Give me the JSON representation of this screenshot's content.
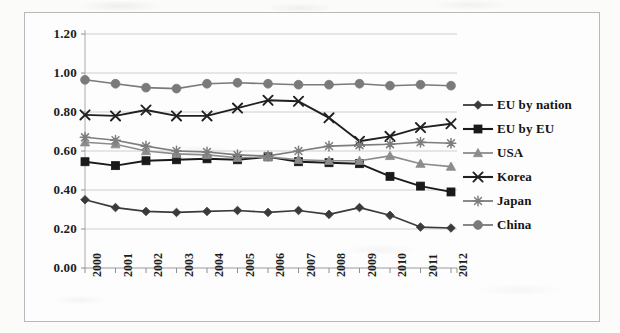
{
  "chart_data": {
    "type": "line",
    "title": "",
    "subtitle": "",
    "xlabel": "",
    "ylabel": "",
    "categories": [
      "2000",
      "2001",
      "2002",
      "2003",
      "2004",
      "2005",
      "2006",
      "2007",
      "2008",
      "2009",
      "2010",
      "2011",
      "2012"
    ],
    "x": [
      2000,
      2001,
      2002,
      2003,
      2004,
      2005,
      2006,
      2007,
      2008,
      2009,
      2010,
      2011,
      2012
    ],
    "ylim": [
      0.0,
      1.2
    ],
    "ytick_labels": [
      "1.20",
      "1.00",
      "0.80",
      "0.60",
      "0.40",
      "0.20",
      "0.00"
    ],
    "ytick_values": [
      1.2,
      1.0,
      0.8,
      0.6,
      0.4,
      0.2,
      0.0
    ],
    "ytick_step": 0.2,
    "grid": "horizontal",
    "legend_position": "right",
    "series": [
      {
        "name": "EU by nation",
        "marker": "diamond",
        "color": "#3a3a3a",
        "values": [
          0.35,
          0.31,
          0.29,
          0.285,
          0.29,
          0.295,
          0.285,
          0.295,
          0.275,
          0.31,
          0.27,
          0.21,
          0.205
        ]
      },
      {
        "name": "EU by EU",
        "marker": "square",
        "color": "#1a1a1a",
        "values": [
          0.545,
          0.525,
          0.55,
          0.555,
          0.56,
          0.555,
          0.57,
          0.545,
          0.54,
          0.535,
          0.47,
          0.42,
          0.39
        ]
      },
      {
        "name": "USA",
        "marker": "triangle",
        "color": "#8c8c8c",
        "values": [
          0.645,
          0.635,
          0.6,
          0.585,
          0.58,
          0.565,
          0.57,
          0.555,
          0.55,
          0.55,
          0.575,
          0.535,
          0.52
        ]
      },
      {
        "name": "Korea",
        "marker": "x",
        "color": "#202020",
        "values": [
          0.785,
          0.78,
          0.81,
          0.78,
          0.78,
          0.82,
          0.86,
          0.855,
          0.77,
          0.65,
          0.675,
          0.72,
          0.74
        ]
      },
      {
        "name": "Japan",
        "marker": "asterisk",
        "color": "#7d7d7d",
        "values": [
          0.67,
          0.655,
          0.625,
          0.6,
          0.595,
          0.58,
          0.575,
          0.6,
          0.625,
          0.63,
          0.635,
          0.645,
          0.64
        ]
      },
      {
        "name": "China",
        "marker": "circle",
        "color": "#7a7a7a",
        "values": [
          0.965,
          0.945,
          0.925,
          0.92,
          0.945,
          0.95,
          0.945,
          0.94,
          0.94,
          0.945,
          0.935,
          0.94,
          0.935
        ]
      }
    ]
  }
}
